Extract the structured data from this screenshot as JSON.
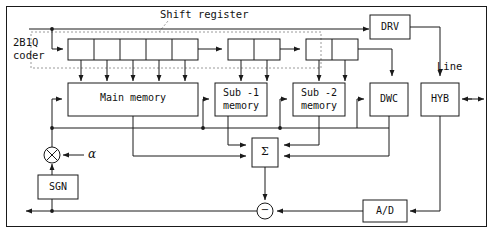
{
  "diagram": {
    "title_label": "Shift register",
    "line_label": "Line",
    "coder_label_line1": "2B1Q",
    "coder_label_line2": "coder",
    "alpha_label": "α",
    "sigma_label": "Σ",
    "minus_label": "−",
    "times_label": "×"
  },
  "blocks": {
    "main_memory": {
      "label": "Main memory"
    },
    "sub1_memory": {
      "label_line1": "Sub -1",
      "label_line2": "memory"
    },
    "sub2_memory": {
      "label_line1": "Sub -2",
      "label_line2": "memory"
    },
    "drv": {
      "label": "DRV"
    },
    "dwc": {
      "label": "DWC"
    },
    "hyb": {
      "label": "HYB"
    },
    "sgn": {
      "label": "SGN"
    },
    "ad": {
      "label": "A/D"
    }
  },
  "shift_register": {
    "group1_cells": 5,
    "group2_cells": 2,
    "group3_cells": 2
  },
  "colors": {
    "stroke": "#1a1a1a",
    "dashed": "#9a9a9a",
    "background": "#ffffff",
    "text": "#111111"
  }
}
